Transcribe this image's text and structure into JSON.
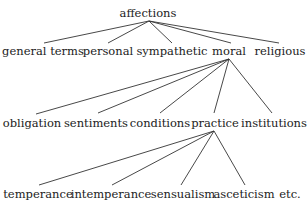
{
  "diagram": {
    "type": "tree",
    "root": {
      "label": "affections",
      "x": 148,
      "y": 17,
      "apex": [
        149,
        21
      ]
    },
    "levels": [
      {
        "parent": "affections",
        "parent_apex": [
          149,
          21
        ],
        "label_y": 55,
        "nodes": [
          {
            "label": "general terms",
            "x": 43,
            "end": [
              44,
              43
            ]
          },
          {
            "label": "personal",
            "x": 108,
            "end": [
              108,
              43
            ]
          },
          {
            "label": "sympathetic",
            "x": 172,
            "end": [
              172,
              43
            ]
          },
          {
            "label": "moral",
            "x": 229,
            "end": [
              231,
              43
            ]
          },
          {
            "label": "religious",
            "x": 280,
            "end": [
              279,
              43
            ]
          }
        ]
      },
      {
        "parent": "moral",
        "parent_apex": [
          229,
          59
        ],
        "label_y": 127,
        "nodes": [
          {
            "label": "obligation",
            "x": 32,
            "end": [
              36,
              114
            ]
          },
          {
            "label": "sentiments",
            "x": 96,
            "end": [
              98,
              113
            ]
          },
          {
            "label": "conditions",
            "x": 160,
            "end": [
              160,
              113
            ]
          },
          {
            "label": "practice",
            "x": 215,
            "end": [
              214,
              113
            ]
          },
          {
            "label": "institutions",
            "x": 274,
            "end": [
              272,
              113
            ]
          }
        ]
      },
      {
        "parent": "practice",
        "parent_apex": [
          214,
          131
        ],
        "label_y": 198,
        "nodes": [
          {
            "label": "temperance",
            "x": 38,
            "end": [
              39,
              185
            ]
          },
          {
            "label": "intemperance",
            "x": 111,
            "end": [
              112,
              185
            ]
          },
          {
            "label": "sensualism",
            "x": 183,
            "end": [
              181,
              185
            ]
          },
          {
            "label": "asceticism",
            "x": 244,
            "end": [
              245,
              185
            ]
          },
          {
            "label": "etc.",
            "x": 290,
            "end": null
          }
        ]
      }
    ]
  }
}
